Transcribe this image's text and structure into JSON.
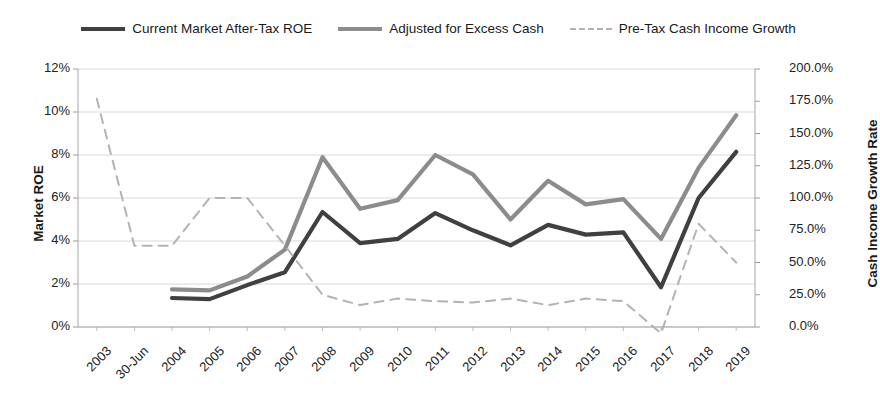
{
  "title": "",
  "legend": {
    "position": "top",
    "items": [
      {
        "label": "Current Market After-Tax ROE",
        "color": "#404040",
        "style": "solid",
        "axis": "left"
      },
      {
        "label": "Adjusted for Excess Cash",
        "color": "#8c8c8c",
        "style": "solid",
        "axis": "left"
      },
      {
        "label": "Pre-Tax Cash Income Growth",
        "color": "#b3b3b3",
        "style": "dashed",
        "axis": "right"
      }
    ]
  },
  "axes": {
    "left": {
      "label": "Market ROE",
      "ticks": [
        "12%",
        "10%",
        "8%",
        "6%",
        "4%",
        "2%",
        "0%"
      ],
      "min": 0,
      "max": 12
    },
    "right": {
      "label": "Cash Income Growth Rate",
      "ticks": [
        "200.0%",
        "175.0%",
        "150.0%",
        "125.0%",
        "100.0%",
        "75.0%",
        "50.0%",
        "25.0%",
        "0.0%"
      ],
      "min": 0,
      "max": 200
    },
    "x": {
      "label": "",
      "ticks": [
        "2003",
        "30-Jun",
        "2004",
        "2005",
        "2006",
        "2007",
        "2008",
        "2009",
        "2010",
        "2011",
        "2012",
        "2013",
        "2014",
        "2015",
        "2016",
        "2017",
        "2018",
        "2019"
      ]
    }
  },
  "chart_data": {
    "type": "line",
    "title": "",
    "xlabel": "",
    "ylabel": "Market ROE",
    "y2label": "Cash Income Growth Rate",
    "grid": true,
    "legend_position": "top",
    "categories": [
      "2003",
      "30-Jun",
      "2004",
      "2005",
      "2006",
      "2007",
      "2008",
      "2009",
      "2010",
      "2011",
      "2012",
      "2013",
      "2014",
      "2015",
      "2016",
      "2017",
      "2018",
      "2019"
    ],
    "ylim": [
      0,
      12
    ],
    "y2lim": [
      0,
      200
    ],
    "series": [
      {
        "name": "Current Market After-Tax ROE",
        "axis": "left",
        "color": "#404040",
        "style": "solid",
        "units": "percent",
        "values": [
          null,
          null,
          1.35,
          1.3,
          1.95,
          2.55,
          5.35,
          3.9,
          4.1,
          5.3,
          4.5,
          3.8,
          4.75,
          4.3,
          4.4,
          1.85,
          6.0,
          8.15
        ]
      },
      {
        "name": "Adjusted for Excess Cash",
        "axis": "left",
        "color": "#8c8c8c",
        "style": "solid",
        "units": "percent",
        "values": [
          null,
          null,
          1.75,
          1.7,
          2.35,
          3.6,
          7.9,
          5.5,
          5.9,
          8.0,
          7.1,
          5.0,
          6.8,
          5.7,
          5.95,
          4.1,
          7.4,
          9.85
        ]
      },
      {
        "name": "Pre-Tax Cash Income Growth",
        "axis": "right",
        "color": "#b3b3b3",
        "style": "dashed",
        "units": "percent",
        "values": [
          177,
          63,
          63,
          100,
          100,
          63,
          25,
          17,
          22,
          20,
          19,
          22,
          17,
          22,
          20,
          -5,
          80,
          50
        ]
      }
    ]
  }
}
